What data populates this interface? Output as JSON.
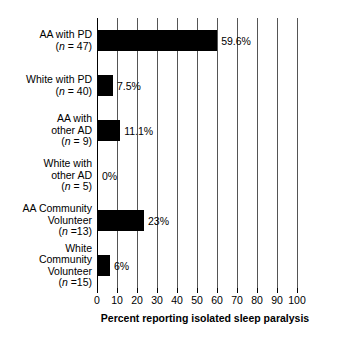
{
  "chart_data": {
    "type": "bar",
    "orientation": "horizontal",
    "title": "",
    "xlabel": "Percent reporting isolated sleep paralysis",
    "ylabel": "",
    "xlim": [
      0,
      100
    ],
    "xticks": [
      0,
      10,
      20,
      30,
      40,
      50,
      60,
      70,
      80,
      90,
      100
    ],
    "xtick_labels": [
      "0",
      "10",
      "20",
      "30",
      "40",
      "50",
      "60",
      "70",
      "80",
      "90",
      "100"
    ],
    "grid": "vertical",
    "legend": "none",
    "bar_color": "#000000",
    "categories": [
      "AA with PD (n = 47)",
      "White with PD (n = 40)",
      "AA with other AD (n = 9)",
      "White with other AD (n = 5)",
      "AA Community Volunteer (n =13)",
      "White Community Volunteer (n =15)"
    ],
    "values": [
      59.6,
      7.5,
      11.1,
      0,
      23,
      6
    ],
    "data_labels": [
      "59.6%",
      "7.5%",
      "11.1%",
      "0%",
      "23%",
      "6%"
    ],
    "group_n": [
      47,
      40,
      9,
      5,
      13,
      15
    ]
  },
  "categories_rows": [
    {
      "lines": [
        "AA with PD"
      ],
      "n_prefix": "(",
      "n_italic": "n",
      "n_suffix": " = 47)",
      "value_label": "59.6%",
      "value": 59.6
    },
    {
      "lines": [
        "White with PD"
      ],
      "n_prefix": "(",
      "n_italic": "n",
      "n_suffix": " = 40)",
      "value_label": "7.5%",
      "value": 7.5
    },
    {
      "lines": [
        "AA with",
        "other AD"
      ],
      "n_prefix": "(",
      "n_italic": "n",
      "n_suffix": " = 9)",
      "value_label": "11.1%",
      "value": 11.1
    },
    {
      "lines": [
        "White with",
        "other AD"
      ],
      "n_prefix": "(",
      "n_italic": "n",
      "n_suffix": " = 5)",
      "value_label": "0%",
      "value": 0
    },
    {
      "lines": [
        "AA Community",
        "Volunteer"
      ],
      "n_prefix": "(",
      "n_italic": "n",
      "n_suffix": " =13)",
      "value_label": "23%",
      "value": 23
    },
    {
      "lines": [
        "White",
        "Community",
        "Volunteer"
      ],
      "n_prefix": "(",
      "n_italic": "n",
      "n_suffix": " =15)",
      "value_label": "6%",
      "value": 6
    }
  ],
  "axis": {
    "x_title": "Percent reporting isolated sleep paralysis",
    "ticks": [
      "0",
      "10",
      "20",
      "30",
      "40",
      "50",
      "60",
      "70",
      "80",
      "90",
      "100"
    ]
  }
}
